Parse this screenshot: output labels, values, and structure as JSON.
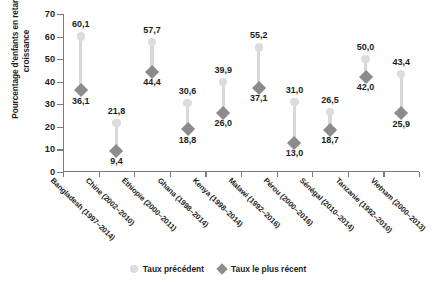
{
  "chart_data": {
    "type": "scatter",
    "subtype": "dumbbell",
    "title": "",
    "xlabel": "",
    "ylabel": "Pourcentage d'enfants en retard de croissance",
    "ylim": [
      0,
      70
    ],
    "ytick_step": 10,
    "yticks": [
      "70",
      "60",
      "50",
      "40",
      "30",
      "20",
      "10",
      "0"
    ],
    "grid": false,
    "legend_position": "bottom",
    "categories": [
      "Bangladesh (1997–2014)",
      "Chine (2002–2010)",
      "Éthiopie (2000–2011)",
      "Ghana (1998–2014)",
      "Kenya (1998–2014)",
      "Malawi (1992–2016)",
      "Pérou (2000–2016)",
      "Sénégal (2010–2014)",
      "Tanzanie (1992–2010)",
      "Vietnam (2000–2013)"
    ],
    "series": [
      {
        "name": "Taux précédent",
        "marker": "circle",
        "color": "#dcdcdc",
        "values": [
          60.1,
          21.8,
          57.7,
          30.6,
          39.9,
          55.2,
          31.0,
          26.5,
          50.0,
          43.4
        ],
        "labels": [
          "60,1",
          "21,8",
          "57,7",
          "30,6",
          "39,9",
          "55,2",
          "31,0",
          "26,5",
          "50,0",
          "43,4"
        ]
      },
      {
        "name": "Taux le plus récent",
        "marker": "diamond",
        "color": "#8c8c8c",
        "values": [
          36.1,
          9.4,
          44.4,
          18.8,
          26.0,
          37.1,
          13.0,
          18.7,
          42.0,
          25.9
        ],
        "labels": [
          "36,1",
          "9,4",
          "44,4",
          "18,8",
          "26,0",
          "37,1",
          "13,0",
          "18,7",
          "42,0",
          "25,9"
        ]
      }
    ],
    "stem_color": "#d8d8d8",
    "axis_color": "#7b7b7b"
  },
  "legend": {
    "items": [
      {
        "label": "Taux précédent",
        "icon": "circle-marker-icon"
      },
      {
        "label": "Taux le plus récent",
        "icon": "diamond-marker-icon"
      }
    ]
  }
}
